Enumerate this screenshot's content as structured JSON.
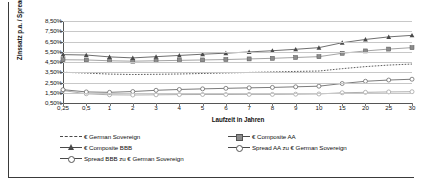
{
  "chart_data": {
    "type": "line",
    "title": "",
    "xlabel": "Laufzeit in Jahren",
    "ylabel": "Zinssatz p.a. / Spread",
    "categories": [
      "0,25",
      "0,5",
      "1",
      "2",
      "3",
      "4",
      "5",
      "6",
      "7",
      "8",
      "9",
      "10",
      "15",
      "20",
      "25",
      "30"
    ],
    "ylim": [
      0.5,
      8.5
    ],
    "ytick_labels": [
      "8,50%",
      "7,50%",
      "6,50%",
      "5,50%",
      "4,50%",
      "3,50%",
      "2,50%",
      "1,50%",
      "0,50%"
    ],
    "ytick_values": [
      8.5,
      7.5,
      6.5,
      5.5,
      4.5,
      3.5,
      2.5,
      1.5,
      0.5
    ],
    "grid": true,
    "legend_position": "bottom",
    "series": [
      {
        "name": "€ German Sovereign",
        "marker": "none",
        "line": "dashed",
        "color": "#4a4a4a",
        "values": [
          3.5,
          3.42,
          3.32,
          3.28,
          3.3,
          3.33,
          3.38,
          3.43,
          3.48,
          3.53,
          3.58,
          3.62,
          3.85,
          4.05,
          4.2,
          4.3
        ]
      },
      {
        "name": "€ Composite AA",
        "marker": "filled-square",
        "line": "solid",
        "color": "#8c8c8c",
        "values": [
          4.72,
          4.7,
          4.62,
          4.58,
          4.62,
          4.66,
          4.7,
          4.74,
          4.8,
          4.86,
          4.94,
          5.02,
          5.35,
          5.58,
          5.76,
          5.9
        ]
      },
      {
        "name": "€ Composite BBB",
        "marker": "filled-triangle",
        "line": "solid",
        "color": "#4a4a4a",
        "values": [
          5.22,
          5.18,
          5.0,
          4.9,
          5.02,
          5.14,
          5.26,
          5.36,
          5.48,
          5.6,
          5.74,
          5.9,
          6.38,
          6.7,
          6.95,
          7.1
        ]
      },
      {
        "name": "Spread AA zu € German Sovereign",
        "marker": "open-circle",
        "line": "solid",
        "color": "#9a9a9a",
        "values": [
          1.72,
          1.4,
          1.3,
          1.28,
          1.3,
          1.32,
          1.33,
          1.33,
          1.34,
          1.34,
          1.36,
          1.38,
          1.5,
          1.54,
          1.58,
          1.6
        ]
      },
      {
        "name": "Spread BBB zu € German Sovereign",
        "marker": "open-circle",
        "line": "solid",
        "color": "#5a5a5a",
        "values": [
          1.8,
          1.58,
          1.54,
          1.62,
          1.74,
          1.82,
          1.88,
          1.93,
          1.98,
          2.02,
          2.08,
          2.14,
          2.4,
          2.62,
          2.74,
          2.82
        ]
      }
    ]
  },
  "legend": {
    "items": [
      {
        "label": "€ German Sovereign",
        "marker": "dashed-line-icon"
      },
      {
        "label": "€ Composite AA",
        "marker": "filled-square-icon"
      },
      {
        "label": "€ Composite BBB",
        "marker": "filled-triangle-icon"
      },
      {
        "label": "Spread AA zu € German Sovereign",
        "marker": "open-circle-icon"
      },
      {
        "label": "Spread BBB zu € German Sovereign",
        "marker": "open-circle-icon"
      }
    ]
  }
}
